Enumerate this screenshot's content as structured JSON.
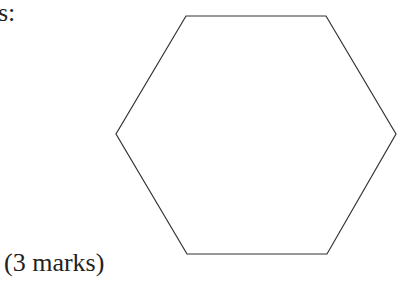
{
  "question": {
    "prompt_fragment": "s:",
    "marks_label": "(3 marks)"
  },
  "figure": {
    "shape": "regular hexagon",
    "stroke_color": "#333333",
    "vertices": [
      [
        186,
        16
      ],
      [
        326,
        16
      ],
      [
        396,
        134
      ],
      [
        327,
        254
      ],
      [
        187,
        254
      ],
      [
        116,
        134
      ]
    ]
  }
}
